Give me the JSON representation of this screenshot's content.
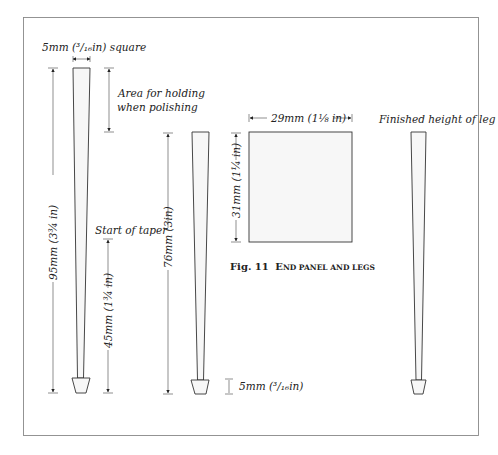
{
  "figure": {
    "number": "Fig. 11",
    "caption_first": "E",
    "caption_rest": "ND PANEL AND LEGS",
    "caption_full": "Fig. 11 End panel and legs"
  },
  "labels": {
    "square": "5mm (³/₁₆in) square",
    "holding_line1": "Area for holding",
    "holding_line2": "when polishing",
    "start_taper": "Start of taper",
    "total_height": "95mm (3¾ in)",
    "taper_length": "45mm (1¾ in)",
    "leg_height": "76mm (3in)",
    "foot_height": "5mm (³/₁₆in)",
    "panel_width": "29mm (1⅛ in)",
    "panel_height": "31mm (1¼ in)",
    "finished_leg": "Finished height of leg"
  },
  "colors": {
    "line": "#333333",
    "panel_fill": "#f7f7f7",
    "frame": "#888888"
  }
}
